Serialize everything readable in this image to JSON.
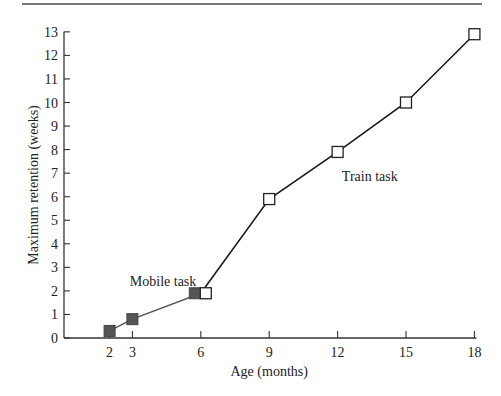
{
  "chart_data": {
    "type": "line",
    "title": "",
    "xlabel": "Age (months)",
    "ylabel": "Maximum retention (weeks)",
    "xlim": [
      0,
      18
    ],
    "ylim": [
      0,
      13
    ],
    "x_ticks": [
      2,
      3,
      6,
      9,
      12,
      15,
      18
    ],
    "y_ticks": [
      0,
      1,
      2,
      3,
      4,
      5,
      6,
      7,
      8,
      9,
      10,
      11,
      12,
      13
    ],
    "grid": false,
    "legend": "none (inline annotations)",
    "series": [
      {
        "name": "Mobile task",
        "marker": "filled-square",
        "color": "#555555",
        "x": [
          2,
          3,
          6
        ],
        "values": [
          0.3,
          0.8,
          1.9
        ]
      },
      {
        "name": "Train task",
        "marker": "open-square",
        "color": "#1a1a1a",
        "x": [
          6,
          9,
          12,
          15,
          18
        ],
        "values": [
          1.9,
          5.9,
          7.9,
          10.0,
          12.9
        ]
      }
    ],
    "annotations": [
      {
        "text": "Mobile task",
        "x": 3.5,
        "y": 2.4
      },
      {
        "text": "Train task",
        "x": 12.8,
        "y": 6.9
      }
    ]
  }
}
